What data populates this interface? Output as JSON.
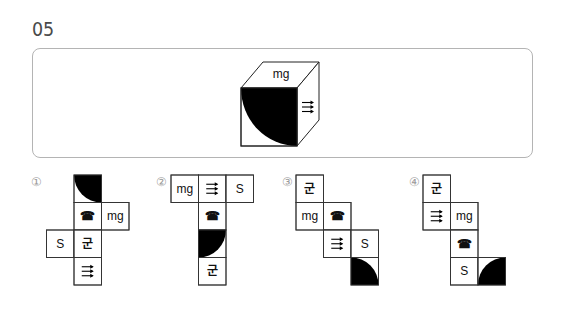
{
  "question": {
    "number": "05"
  },
  "cube": {
    "faces": {
      "top": {
        "symbol": "mg"
      },
      "front": {
        "symbol": "quarter-disc",
        "corner": "top-right"
      },
      "right": {
        "symbol": "triple-arrow"
      }
    }
  },
  "symbols": {
    "mg": "mg",
    "S": "S",
    "gun": "군",
    "phone": "☎"
  },
  "options": [
    {
      "label": "①",
      "cells": [
        {
          "col": 1,
          "row": 0,
          "symbol": "quarter-disc",
          "corner": "top-right"
        },
        {
          "col": 1,
          "row": 1,
          "symbol": "phone"
        },
        {
          "col": 2,
          "row": 1,
          "symbol": "mg"
        },
        {
          "col": 0,
          "row": 2,
          "symbol": "S"
        },
        {
          "col": 1,
          "row": 2,
          "symbol": "gun"
        },
        {
          "col": 1,
          "row": 3,
          "symbol": "triple-arrow"
        }
      ]
    },
    {
      "label": "②",
      "cells": [
        {
          "col": 0,
          "row": 0,
          "symbol": "mg"
        },
        {
          "col": 1,
          "row": 0,
          "symbol": "triple-arrow"
        },
        {
          "col": 2,
          "row": 0,
          "symbol": "S"
        },
        {
          "col": 1,
          "row": 1,
          "symbol": "phone"
        },
        {
          "col": 1,
          "row": 2,
          "symbol": "quarter-disc",
          "corner": "top-left"
        },
        {
          "col": 1,
          "row": 3,
          "symbol": "gun"
        }
      ]
    },
    {
      "label": "③",
      "cells": [
        {
          "col": 0,
          "row": 0,
          "symbol": "gun"
        },
        {
          "col": 0,
          "row": 1,
          "symbol": "mg"
        },
        {
          "col": 1,
          "row": 1,
          "symbol": "phone"
        },
        {
          "col": 1,
          "row": 2,
          "symbol": "triple-arrow"
        },
        {
          "col": 2,
          "row": 2,
          "symbol": "S"
        },
        {
          "col": 2,
          "row": 3,
          "symbol": "quarter-disc",
          "corner": "bottom-left"
        }
      ]
    },
    {
      "label": "④",
      "cells": [
        {
          "col": 0,
          "row": 0,
          "symbol": "gun"
        },
        {
          "col": 0,
          "row": 1,
          "symbol": "triple-arrow"
        },
        {
          "col": 1,
          "row": 1,
          "symbol": "mg"
        },
        {
          "col": 1,
          "row": 2,
          "symbol": "phone"
        },
        {
          "col": 1,
          "row": 3,
          "symbol": "S"
        },
        {
          "col": 2,
          "row": 3,
          "symbol": "quarter-disc",
          "corner": "bottom-right"
        }
      ]
    }
  ]
}
